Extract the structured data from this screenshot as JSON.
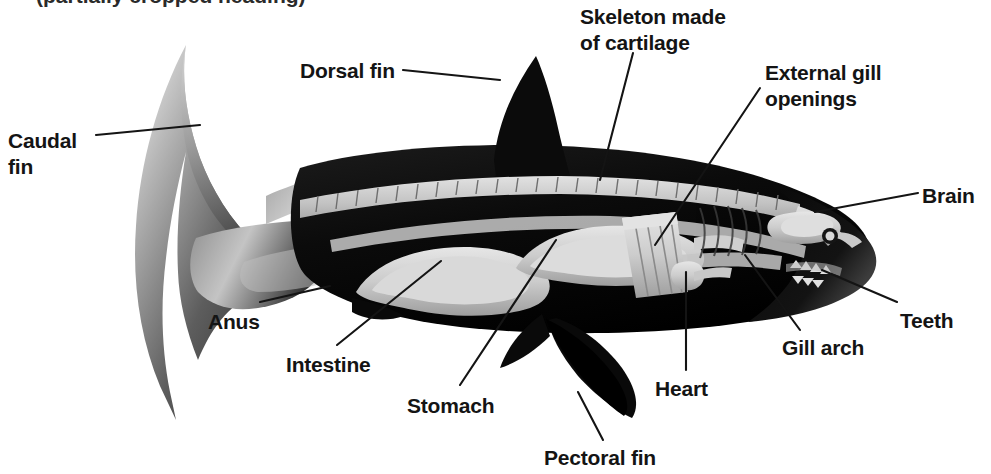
{
  "figure": {
    "kind": "anatomy-diagram",
    "view": "lateral cutaway",
    "background_color": "#ffffff",
    "ink_color": "#141414",
    "body_color": "#0d0d0d",
    "organ_color": "#c9c9c9",
    "fin_gradient_light": "#cfcfcf",
    "fin_gradient_dark": "#2b2b2b",
    "clipped_top_text": "(partially cropped heading)"
  },
  "labels": [
    {
      "id": "caudal-fin",
      "text": "Caudal\nfin",
      "x": 8,
      "y": 128,
      "align": "left",
      "name": "label-caudal-fin"
    },
    {
      "id": "dorsal-fin",
      "text": "Dorsal fin",
      "x": 300,
      "y": 58,
      "align": "left",
      "name": "label-dorsal-fin"
    },
    {
      "id": "skeleton",
      "text": "Skeleton made\nof cartilage",
      "x": 580,
      "y": 4,
      "align": "left",
      "name": "label-skeleton-cartilage"
    },
    {
      "id": "gill-openings",
      "text": "External gill\nopenings",
      "x": 765,
      "y": 60,
      "align": "left",
      "name": "label-external-gill-openings"
    },
    {
      "id": "brain",
      "text": "Brain",
      "x": 922,
      "y": 183,
      "align": "left",
      "name": "label-brain"
    },
    {
      "id": "teeth",
      "text": "Teeth",
      "x": 900,
      "y": 308,
      "align": "left",
      "name": "label-teeth"
    },
    {
      "id": "gill-arch",
      "text": "Gill arch",
      "x": 782,
      "y": 335,
      "align": "left",
      "name": "label-gill-arch"
    },
    {
      "id": "heart",
      "text": "Heart",
      "x": 655,
      "y": 376,
      "align": "left",
      "name": "label-heart"
    },
    {
      "id": "pectoral-fin",
      "text": "Pectoral fin",
      "x": 544,
      "y": 445,
      "align": "left",
      "name": "label-pectoral-fin"
    },
    {
      "id": "stomach",
      "text": "Stomach",
      "x": 407,
      "y": 393,
      "align": "left",
      "name": "label-stomach"
    },
    {
      "id": "intestine",
      "text": "Intestine",
      "x": 286,
      "y": 352,
      "align": "left",
      "name": "label-intestine"
    },
    {
      "id": "anus",
      "text": "Anus",
      "x": 208,
      "y": 309,
      "align": "left",
      "name": "label-anus"
    }
  ],
  "leader_lines": [
    {
      "id": "caudal-fin",
      "from": [
        96,
        135
      ],
      "to": [
        200,
        125
      ],
      "name": "leader-caudal-fin"
    },
    {
      "id": "dorsal-fin",
      "from": [
        403,
        70
      ],
      "to": [
        500,
        80
      ],
      "name": "leader-dorsal-fin"
    },
    {
      "id": "skeleton",
      "from": [
        633,
        53
      ],
      "to": [
        600,
        180
      ],
      "name": "leader-skeleton-cartilage"
    },
    {
      "id": "gill-openings",
      "from": [
        760,
        88
      ],
      "to": [
        655,
        245
      ],
      "name": "leader-external-gill-openings"
    },
    {
      "id": "brain",
      "from": [
        918,
        193
      ],
      "to": [
        815,
        212
      ],
      "name": "leader-brain"
    },
    {
      "id": "teeth",
      "from": [
        897,
        302
      ],
      "to": [
        822,
        270
      ],
      "name": "leader-teeth"
    },
    {
      "id": "gill-arch",
      "from": [
        800,
        330
      ],
      "to": [
        745,
        255
      ],
      "name": "leader-gill-arch"
    },
    {
      "id": "heart",
      "from": [
        686,
        370
      ],
      "to": [
        686,
        272
      ],
      "name": "leader-heart"
    },
    {
      "id": "pectoral-fin",
      "from": [
        603,
        440
      ],
      "to": [
        578,
        392
      ],
      "name": "leader-pectoral-fin"
    },
    {
      "id": "stomach",
      "from": [
        460,
        385
      ],
      "to": [
        556,
        240
      ],
      "name": "leader-stomach"
    },
    {
      "id": "intestine",
      "from": [
        337,
        345
      ],
      "to": [
        441,
        261
      ],
      "name": "leader-intestine"
    },
    {
      "id": "anus",
      "from": [
        260,
        302
      ],
      "to": [
        330,
        286
      ],
      "name": "leader-anus"
    }
  ],
  "anatomy_parts": [
    {
      "id": "body",
      "label": "shark body",
      "name": "shark-body"
    },
    {
      "id": "caudal-fin",
      "label": "caudal fin",
      "name": "caudal-fin-shape"
    },
    {
      "id": "dorsal-fin",
      "label": "dorsal fin",
      "name": "dorsal-fin-shape"
    },
    {
      "id": "pectoral-fin",
      "label": "pectoral fin",
      "name": "pectoral-fin-shape"
    },
    {
      "id": "pelvic-fin",
      "label": "pelvic fin",
      "name": "pelvic-fin-shape"
    },
    {
      "id": "vertebral-column",
      "label": "skeleton made of cartilage",
      "name": "vertebral-column-shape"
    },
    {
      "id": "intestine",
      "label": "intestine",
      "name": "intestine-shape"
    },
    {
      "id": "stomach",
      "label": "stomach",
      "name": "stomach-shape"
    },
    {
      "id": "gill-arches",
      "label": "gill arches",
      "name": "gill-arches-shape"
    },
    {
      "id": "heart",
      "label": "heart",
      "name": "heart-shape"
    },
    {
      "id": "brain",
      "label": "brain",
      "name": "brain-shape"
    },
    {
      "id": "eye",
      "label": "eye",
      "name": "eye-shape"
    },
    {
      "id": "teeth",
      "label": "teeth",
      "name": "teeth-shape"
    }
  ]
}
